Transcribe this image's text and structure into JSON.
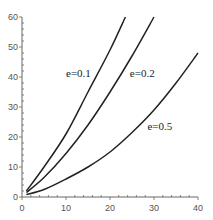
{
  "chart_data": {
    "type": "line",
    "title": "",
    "xlabel": "",
    "ylabel": "",
    "xlim": [
      0,
      40
    ],
    "ylim": [
      0,
      60
    ],
    "grid": false,
    "legend": "inline labels",
    "x_ticks": [
      0,
      10,
      20,
      30,
      40
    ],
    "y_ticks": [
      0,
      10,
      20,
      30,
      40,
      50,
      60
    ],
    "series": [
      {
        "name": "e=0.1",
        "label_pos": [
          10,
          40
        ],
        "points": [
          [
            1,
            2
          ],
          [
            5,
            10
          ],
          [
            10,
            21
          ],
          [
            15,
            35
          ],
          [
            20,
            49
          ],
          [
            23.5,
            60
          ]
        ]
      },
      {
        "name": "e=0.2",
        "label_pos": [
          24.5,
          40
        ],
        "points": [
          [
            1,
            1.5
          ],
          [
            5,
            6.5
          ],
          [
            10,
            14.5
          ],
          [
            15,
            24
          ],
          [
            20,
            35
          ],
          [
            25,
            47
          ],
          [
            30,
            60
          ]
        ]
      },
      {
        "name": "e=0.5",
        "label_pos": [
          28.5,
          22.5
        ],
        "points": [
          [
            1,
            0.8
          ],
          [
            5,
            2.5
          ],
          [
            10,
            6
          ],
          [
            15,
            10
          ],
          [
            20,
            15
          ],
          [
            25,
            21.5
          ],
          [
            30,
            29
          ],
          [
            35,
            38
          ],
          [
            40,
            48
          ]
        ]
      }
    ]
  },
  "colors": {
    "curve": "#222222",
    "axis": "#666666",
    "text": "#555555"
  }
}
